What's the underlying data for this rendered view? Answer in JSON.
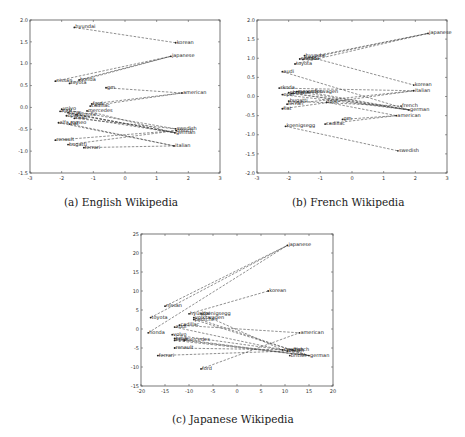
{
  "captions": {
    "a": "(a) English Wikipedia",
    "b": "(b) French Wikipedia",
    "c": "(c) Japanese Wikipedia"
  },
  "chart_data": [
    {
      "id": "a",
      "type": "scatter",
      "title": "(a) English Wikipedia",
      "xlim": [
        -3,
        3
      ],
      "ylim": [
        -1.5,
        2.0
      ],
      "xticks": [
        -3,
        -2,
        -1,
        0,
        1,
        2,
        3
      ],
      "yticks": [
        -1.5,
        -1.0,
        -0.5,
        0.0,
        0.5,
        1.0,
        1.5,
        2.0
      ],
      "grid": false,
      "box": {
        "x": 30,
        "y": 20,
        "w": 190,
        "h": 153
      },
      "points": [
        {
          "label": "hyundai",
          "x": -1.6,
          "y": 1.83
        },
        {
          "label": "korean",
          "x": 1.6,
          "y": 1.48
        },
        {
          "label": "japanese",
          "x": 1.45,
          "y": 1.17
        },
        {
          "label": "nissan",
          "x": -2.2,
          "y": 0.6
        },
        {
          "label": "honda",
          "x": -1.45,
          "y": 0.63
        },
        {
          "label": "toyota",
          "x": -1.75,
          "y": 0.55
        },
        {
          "label": "gm",
          "x": -0.6,
          "y": 0.45
        },
        {
          "label": "american",
          "x": 1.8,
          "y": 0.33
        },
        {
          "label": "ford",
          "x": -1.05,
          "y": 0.08
        },
        {
          "label": "cadillac",
          "x": -1.1,
          "y": 0.03
        },
        {
          "label": "volvo",
          "x": -2.0,
          "y": -0.04
        },
        {
          "label": "mercedes",
          "x": -1.2,
          "y": -0.08
        },
        {
          "label": "audi",
          "x": -2.05,
          "y": -0.09
        },
        {
          "label": "bmw",
          "x": -1.8,
          "y": -0.12
        },
        {
          "label": "opel",
          "x": -1.85,
          "y": -0.19
        },
        {
          "label": "porsche",
          "x": -1.55,
          "y": -0.17
        },
        {
          "label": "saab",
          "x": -1.6,
          "y": -0.25
        },
        {
          "label": "alfa romeo",
          "x": -2.1,
          "y": -0.35
        },
        {
          "label": "fiat",
          "x": -1.75,
          "y": -0.38
        },
        {
          "label": "swedish",
          "x": 1.6,
          "y": -0.49
        },
        {
          "label": "french",
          "x": 1.62,
          "y": -0.53
        },
        {
          "label": "german",
          "x": 1.58,
          "y": -0.58
        },
        {
          "label": "renault",
          "x": -2.2,
          "y": -0.75
        },
        {
          "label": "bugatti",
          "x": -1.8,
          "y": -0.85
        },
        {
          "label": "ferrari",
          "x": -1.3,
          "y": -0.92
        },
        {
          "label": "italian",
          "x": 1.55,
          "y": -0.88
        }
      ],
      "links": [
        [
          "hyundai",
          "korean"
        ],
        [
          "nissan",
          "japanese"
        ],
        [
          "honda",
          "japanese"
        ],
        [
          "toyota",
          "japanese"
        ],
        [
          "gm",
          "american"
        ],
        [
          "ford",
          "american"
        ],
        [
          "cadillac",
          "american"
        ],
        [
          "volvo",
          "swedish"
        ],
        [
          "saab",
          "swedish"
        ],
        [
          "mercedes",
          "german"
        ],
        [
          "audi",
          "german"
        ],
        [
          "bmw",
          "german"
        ],
        [
          "opel",
          "german"
        ],
        [
          "porsche",
          "german"
        ],
        [
          "renault",
          "french"
        ],
        [
          "alfa romeo",
          "italian"
        ],
        [
          "fiat",
          "italian"
        ],
        [
          "bugatti",
          "french"
        ],
        [
          "ferrari",
          "italian"
        ]
      ]
    },
    {
      "id": "b",
      "type": "scatter",
      "title": "(b) French Wikipedia",
      "xlim": [
        -3,
        3
      ],
      "ylim": [
        -2.0,
        2.0
      ],
      "xticks": [
        -3,
        -2,
        -1,
        0,
        1,
        2,
        3
      ],
      "yticks": [
        -2.0,
        -1.5,
        -1.0,
        -0.5,
        0.0,
        0.5,
        1.0,
        1.5,
        2.0
      ],
      "grid": false,
      "box": {
        "x": 257,
        "y": 20,
        "w": 190,
        "h": 153
      },
      "points": [
        {
          "label": "japanese",
          "x": 2.4,
          "y": 1.65
        },
        {
          "label": "hyundai",
          "x": -1.5,
          "y": 1.07
        },
        {
          "label": "nissan",
          "x": -1.65,
          "y": 0.98
        },
        {
          "label": "honda",
          "x": -1.55,
          "y": 0.97
        },
        {
          "label": "toyota",
          "x": -1.8,
          "y": 0.85
        },
        {
          "label": "audi",
          "x": -2.2,
          "y": 0.65
        },
        {
          "label": "korean",
          "x": 1.95,
          "y": 0.3
        },
        {
          "label": "italian",
          "x": 1.95,
          "y": 0.15
        },
        {
          "label": "skoda",
          "x": -2.3,
          "y": 0.22
        },
        {
          "label": "mercedes",
          "x": -1.75,
          "y": 0.13
        },
        {
          "label": "volkswagen",
          "x": -1.4,
          "y": 0.12
        },
        {
          "label": "porsche",
          "x": -2.0,
          "y": 0.1
        },
        {
          "label": "bmw",
          "x": -1.9,
          "y": 0.08
        },
        {
          "label": "opel",
          "x": -2.2,
          "y": 0.05
        },
        {
          "label": "bugatti",
          "x": -2.0,
          "y": -0.12
        },
        {
          "label": "ferrari",
          "x": -2.05,
          "y": -0.2
        },
        {
          "label": "fiat",
          "x": -2.2,
          "y": -0.32
        },
        {
          "label": "ford",
          "x": -0.8,
          "y": -0.15
        },
        {
          "label": "french",
          "x": 1.55,
          "y": -0.25
        },
        {
          "label": "german",
          "x": 1.8,
          "y": -0.35
        },
        {
          "label": "american",
          "x": 1.4,
          "y": -0.5
        },
        {
          "label": "gm",
          "x": -0.3,
          "y": -0.6
        },
        {
          "label": "cadillac",
          "x": -0.85,
          "y": -0.72
        },
        {
          "label": "koenigsegg",
          "x": -2.1,
          "y": -0.78
        },
        {
          "label": "swedish",
          "x": 1.45,
          "y": -1.42
        }
      ],
      "links": [
        [
          "hyundai",
          "korean"
        ],
        [
          "nissan",
          "japanese"
        ],
        [
          "honda",
          "japanese"
        ],
        [
          "toyota",
          "japanese"
        ],
        [
          "audi",
          "german"
        ],
        [
          "mercedes",
          "german"
        ],
        [
          "volkswagen",
          "german"
        ],
        [
          "porsche",
          "german"
        ],
        [
          "bmw",
          "german"
        ],
        [
          "opel",
          "german"
        ],
        [
          "skoda",
          "italian"
        ],
        [
          "bugatti",
          "french"
        ],
        [
          "ferrari",
          "italian"
        ],
        [
          "fiat",
          "italian"
        ],
        [
          "ford",
          "american"
        ],
        [
          "gm",
          "american"
        ],
        [
          "cadillac",
          "american"
        ],
        [
          "koenigsegg",
          "swedish"
        ]
      ]
    },
    {
      "id": "c",
      "type": "scatter",
      "title": "(c) Japanese Wikipedia",
      "xlim": [
        -20,
        20
      ],
      "ylim": [
        -15,
        25
      ],
      "xticks": [
        -20,
        -15,
        -10,
        -5,
        0,
        5,
        10,
        15,
        20
      ],
      "yticks": [
        -15,
        -10,
        -5,
        0,
        5,
        10,
        15,
        20,
        25
      ],
      "grid": false,
      "box": {
        "x": 141,
        "y": 234,
        "w": 192,
        "h": 152
      },
      "points": [
        {
          "label": "japanese",
          "x": 10.5,
          "y": 22
        },
        {
          "label": "korean",
          "x": 6.5,
          "y": 10
        },
        {
          "label": "nissan",
          "x": -15,
          "y": 6
        },
        {
          "label": "toyota",
          "x": -18,
          "y": 3
        },
        {
          "label": "honda",
          "x": -18.5,
          "y": -1
        },
        {
          "label": "hyundai",
          "x": -10,
          "y": 4
        },
        {
          "label": "koenigsegg",
          "x": -7.5,
          "y": 4
        },
        {
          "label": "volkswagen",
          "x": -9,
          "y": 3
        },
        {
          "label": "porsche",
          "x": -9,
          "y": 2.5
        },
        {
          "label": "audi",
          "x": -13,
          "y": 0.5
        },
        {
          "label": "cadillac",
          "x": -12,
          "y": 1
        },
        {
          "label": "volvo",
          "x": -13.5,
          "y": -1.5
        },
        {
          "label": "bmw",
          "x": -13,
          "y": -2.5
        },
        {
          "label": "opel",
          "x": -13,
          "y": -3
        },
        {
          "label": "mercedes",
          "x": -11,
          "y": -3
        },
        {
          "label": "renault",
          "x": -13,
          "y": -5
        },
        {
          "label": "ferrari",
          "x": -16.5,
          "y": -7
        },
        {
          "label": "ford",
          "x": -7.5,
          "y": -10.5
        },
        {
          "label": "american",
          "x": 13,
          "y": -1
        },
        {
          "label": "swedish",
          "x": 9.5,
          "y": -5.5
        },
        {
          "label": "italian",
          "x": 10.5,
          "y": -5.8
        },
        {
          "label": "french",
          "x": 11.5,
          "y": -5.5
        },
        {
          "label": "german",
          "x": 15,
          "y": -7
        },
        {
          "label": "british",
          "x": 11,
          "y": -7
        }
      ],
      "links": [
        [
          "nissan",
          "japanese"
        ],
        [
          "toyota",
          "japanese"
        ],
        [
          "honda",
          "japanese"
        ],
        [
          "hyundai",
          "korean"
        ],
        [
          "koenigsegg",
          "swedish"
        ],
        [
          "volkswagen",
          "german"
        ],
        [
          "porsche",
          "german"
        ],
        [
          "audi",
          "german"
        ],
        [
          "cadillac",
          "american"
        ],
        [
          "volvo",
          "swedish"
        ],
        [
          "bmw",
          "german"
        ],
        [
          "opel",
          "german"
        ],
        [
          "mercedes",
          "german"
        ],
        [
          "renault",
          "french"
        ],
        [
          "ferrari",
          "italian"
        ],
        [
          "ford",
          "american"
        ]
      ]
    }
  ]
}
